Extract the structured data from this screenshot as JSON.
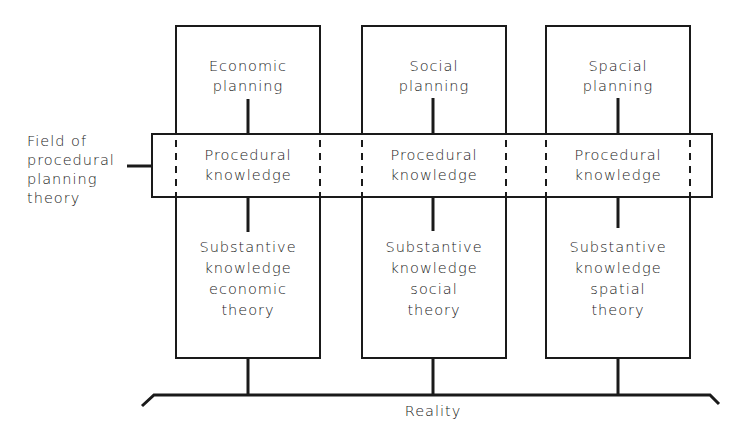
{
  "diagram": {
    "side_label": "Field of\nprocedural\nplanning\ntheory",
    "columns": [
      {
        "planning": "Economic\nplanning",
        "procedural": "Procedural\nknowledge",
        "substantive": "Substantive\nknowledge\neconomic\ntheory"
      },
      {
        "planning": "Social\nplanning",
        "procedural": "Procedural\nknowledge",
        "substantive": "Substantive\nknowledge\nsocial\ntheory"
      },
      {
        "planning": "Spacial\nplanning",
        "procedural": "Procedural\nknowledge",
        "substantive": "Substantive\nknowledge\nspatial\ntheory"
      }
    ],
    "base_label": "Reality",
    "colors": {
      "line": "#1a1a1a",
      "background": "#ffffff"
    }
  }
}
